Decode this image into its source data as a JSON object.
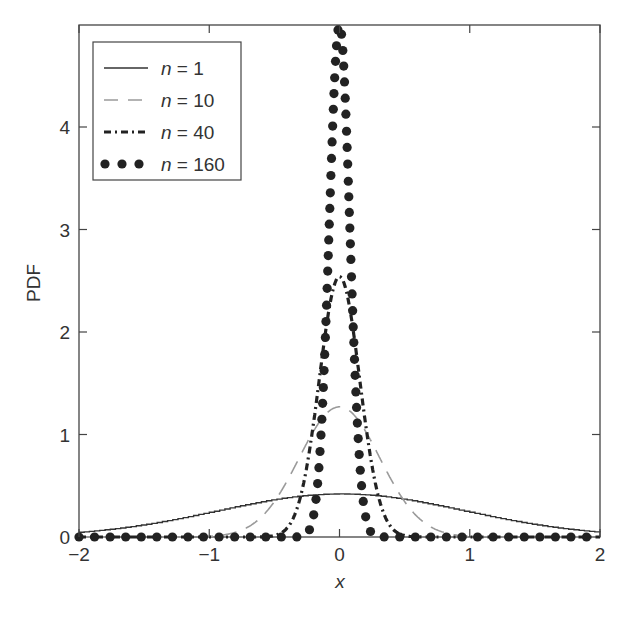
{
  "chart_data": {
    "type": "line",
    "title": "",
    "xlabel": "x",
    "ylabel": "PDF",
    "xlim": [
      -2,
      2
    ],
    "ylim": [
      0,
      5
    ],
    "xticks": [
      -2,
      -1,
      0,
      1,
      2
    ],
    "xtick_labels": [
      "−2",
      "−1",
      "0",
      "1",
      "2"
    ],
    "yticks": [
      0,
      1,
      2,
      3,
      4
    ],
    "ytick_labels": [
      "0",
      "1",
      "2",
      "3",
      "4"
    ],
    "grid": false,
    "legend_position": "upper left",
    "x": [
      -2.0,
      -1.5,
      -1.0,
      -0.75,
      -0.5,
      -0.25,
      0.0,
      0.25,
      0.5,
      0.75,
      1.0,
      1.5,
      2.0
    ],
    "series": [
      {
        "name": "n = 1",
        "label_n": "n",
        "label_eq": " = 1",
        "style": "solid",
        "color": "#333333",
        "values": [
          0.06,
          0.14,
          0.24,
          0.3,
          0.35,
          0.4,
          0.42,
          0.4,
          0.35,
          0.3,
          0.24,
          0.14,
          0.06
        ]
      },
      {
        "name": "n = 10",
        "label_n": "n",
        "label_eq": " = 10",
        "style": "dashed",
        "color": "#9a9a9a",
        "values": [
          0.0,
          0.0,
          0.02,
          0.12,
          0.42,
          0.93,
          1.27,
          0.93,
          0.42,
          0.12,
          0.02,
          0.0,
          0.0
        ]
      },
      {
        "name": "n = 40",
        "label_n": "n",
        "label_eq": " = 40",
        "style": "dashdot",
        "color": "#222222",
        "values": [
          0.0,
          0.0,
          0.0,
          0.0,
          0.05,
          0.95,
          2.54,
          0.95,
          0.05,
          0.0,
          0.0,
          0.0,
          0.0
        ]
      },
      {
        "name": "n = 160",
        "label_n": "n",
        "label_eq": " = 160",
        "style": "dotted",
        "color": "#222222",
        "values": [
          0.0,
          0.0,
          0.0,
          0.0,
          0.0,
          0.04,
          5.0,
          0.04,
          0.0,
          0.0,
          0.0,
          0.0,
          0.0
        ]
      }
    ],
    "sigma": {
      "n = 1": 0.95,
      "n = 10": 0.31,
      "n = 40": 0.155,
      "n = 160": 0.079
    }
  },
  "labels": {
    "xlabel": "x",
    "ylabel": "PDF"
  }
}
